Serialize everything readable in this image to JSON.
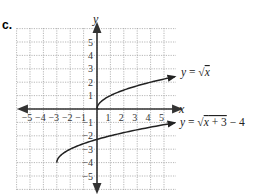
{
  "part_label": "c.",
  "chart_data": {
    "type": "line",
    "title": "",
    "xlabel": "x",
    "ylabel": "y",
    "xlim": [
      -6,
      6
    ],
    "ylim": [
      -6,
      6
    ],
    "grid": true,
    "x_ticks": [
      "-5",
      "-4",
      "-3",
      "-2",
      "-1",
      "1",
      "2",
      "3",
      "4",
      "5"
    ],
    "y_ticks": [
      "5",
      "4",
      "3",
      "2",
      "1",
      "-1",
      "-2",
      "-3",
      "-4",
      "-5"
    ],
    "series": [
      {
        "name": "y = √x",
        "equation_label": "y = √x",
        "x": [
          0,
          0.25,
          0.5,
          1,
          2,
          3,
          4,
          5,
          5.8
        ],
        "values": [
          0,
          0.5,
          0.707,
          1,
          1.414,
          1.732,
          2,
          2.236,
          2.408
        ]
      },
      {
        "name": "y = √(x + 3) − 4",
        "equation_label": "y = √x + 3 − 4",
        "x": [
          -3,
          -2.75,
          -2.5,
          -2,
          -1,
          0,
          1,
          2,
          3,
          4,
          5,
          5.8
        ],
        "values": [
          -4,
          -3.5,
          -3.293,
          -3,
          -2.586,
          -2.268,
          -2,
          -1.764,
          -1.551,
          -1.354,
          -1.172,
          -1.034
        ]
      }
    ]
  }
}
